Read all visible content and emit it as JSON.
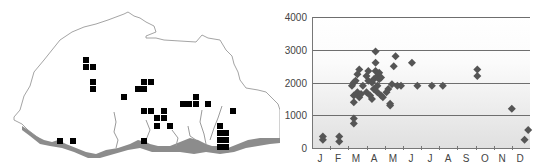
{
  "chart_data": [
    {
      "type": "map",
      "title": "",
      "description": "Outline map with grid-cell occurrence records (black squares) and southern lowland shaded grey",
      "occurrence_cells": [
        [
          86,
          60
        ],
        [
          86,
          67
        ],
        [
          93,
          67
        ],
        [
          93,
          82
        ],
        [
          93,
          89
        ],
        [
          124,
          97
        ],
        [
          138,
          89
        ],
        [
          144,
          82
        ],
        [
          151,
          82
        ],
        [
          144,
          89
        ],
        [
          144,
          111
        ],
        [
          151,
          111
        ],
        [
          164,
          111
        ],
        [
          157,
          118
        ],
        [
          164,
          118
        ],
        [
          157,
          126
        ],
        [
          170,
          126
        ],
        [
          183,
          104
        ],
        [
          189,
          104
        ],
        [
          196,
          97
        ],
        [
          196,
          104
        ],
        [
          208,
          104
        ],
        [
          233,
          111
        ],
        [
          220,
          126
        ],
        [
          220,
          133
        ],
        [
          226,
          133
        ],
        [
          220,
          140
        ],
        [
          226,
          140
        ],
        [
          226,
          147
        ],
        [
          220,
          147
        ],
        [
          60,
          141
        ],
        [
          73,
          141
        ],
        [
          144,
          141
        ]
      ]
    },
    {
      "type": "scatter",
      "title": "",
      "xlabel": "",
      "ylabel": "",
      "ylim": [
        0,
        4000
      ],
      "yticks": [
        0,
        1000,
        2000,
        3000,
        4000
      ],
      "xticks": [
        "J",
        "F",
        "M",
        "A",
        "M",
        "J",
        "J",
        "A",
        "S",
        "O",
        "N",
        "D"
      ],
      "grid": "horizontal",
      "marker": "diamond",
      "marker_color": "#555555",
      "points": [
        {
          "month": 0.6,
          "value": 350
        },
        {
          "month": 0.6,
          "value": 250
        },
        {
          "month": 1.5,
          "value": 350
        },
        {
          "month": 1.5,
          "value": 200
        },
        {
          "month": 2.3,
          "value": 900
        },
        {
          "month": 2.3,
          "value": 750
        },
        {
          "month": 2.2,
          "value": 1900
        },
        {
          "month": 2.3,
          "value": 2000
        },
        {
          "month": 2.4,
          "value": 2050
        },
        {
          "month": 2.3,
          "value": 1600
        },
        {
          "month": 2.3,
          "value": 1400
        },
        {
          "month": 2.5,
          "value": 2250
        },
        {
          "month": 2.6,
          "value": 2400
        },
        {
          "month": 2.5,
          "value": 1700
        },
        {
          "month": 2.6,
          "value": 1550
        },
        {
          "month": 2.7,
          "value": 1650
        },
        {
          "month": 2.8,
          "value": 1900
        },
        {
          "month": 3.0,
          "value": 2200
        },
        {
          "month": 3.1,
          "value": 2350
        },
        {
          "month": 3.1,
          "value": 2050
        },
        {
          "month": 3.0,
          "value": 1700
        },
        {
          "month": 3.2,
          "value": 1600
        },
        {
          "month": 3.3,
          "value": 1500
        },
        {
          "month": 3.3,
          "value": 2000
        },
        {
          "month": 3.4,
          "value": 2100
        },
        {
          "month": 3.4,
          "value": 1800
        },
        {
          "month": 3.5,
          "value": 2950
        },
        {
          "month": 3.5,
          "value": 2600
        },
        {
          "month": 3.5,
          "value": 2350
        },
        {
          "month": 3.6,
          "value": 2200
        },
        {
          "month": 3.6,
          "value": 1900
        },
        {
          "month": 3.6,
          "value": 1700
        },
        {
          "month": 3.7,
          "value": 2300
        },
        {
          "month": 3.7,
          "value": 2100
        },
        {
          "month": 3.8,
          "value": 2150
        },
        {
          "month": 3.8,
          "value": 1600
        },
        {
          "month": 3.9,
          "value": 1550
        },
        {
          "month": 4.1,
          "value": 1700
        },
        {
          "month": 4.2,
          "value": 1800
        },
        {
          "month": 4.3,
          "value": 1350
        },
        {
          "month": 4.3,
          "value": 1300
        },
        {
          "month": 4.4,
          "value": 1950
        },
        {
          "month": 4.5,
          "value": 2500
        },
        {
          "month": 4.6,
          "value": 2800
        },
        {
          "month": 4.7,
          "value": 1900
        },
        {
          "month": 4.9,
          "value": 1900
        },
        {
          "month": 5.5,
          "value": 2600
        },
        {
          "month": 5.8,
          "value": 1900
        },
        {
          "month": 6.6,
          "value": 1900
        },
        {
          "month": 7.2,
          "value": 1900
        },
        {
          "month": 9.1,
          "value": 2400
        },
        {
          "month": 9.1,
          "value": 2200
        },
        {
          "month": 11.0,
          "value": 1200
        },
        {
          "month": 11.7,
          "value": 250
        },
        {
          "month": 11.9,
          "value": 550
        }
      ]
    }
  ],
  "labels": {
    "y0": "0",
    "y1": "1000",
    "y2": "2000",
    "y3": "3000",
    "y4": "4000",
    "m0": "J",
    "m1": "F",
    "m2": "M",
    "m3": "A",
    "m4": "M",
    "m5": "J",
    "m6": "J",
    "m7": "A",
    "m8": "S",
    "m9": "O",
    "m10": "N",
    "m11": "D"
  }
}
